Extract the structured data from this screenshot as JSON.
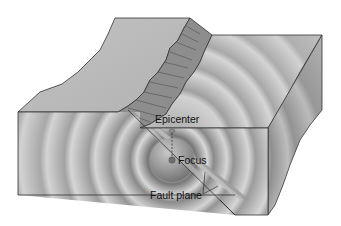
{
  "figure": {
    "type": "earthquake-fault-block-diagram",
    "labels": {
      "epicenter": "Epicenter",
      "focus": "Focus",
      "fault_plane": "Fault plane"
    }
  },
  "colors": {
    "background": "#ffffff",
    "top_surface": "#b9b9b9",
    "front_face": "#c4c4c4",
    "side_face": "#a9a9a9",
    "fault_scarp": "#8c8c8c",
    "ring_dark": "#8e8e8e",
    "ring_light": "#d6d6d6",
    "outline": "#333333"
  }
}
